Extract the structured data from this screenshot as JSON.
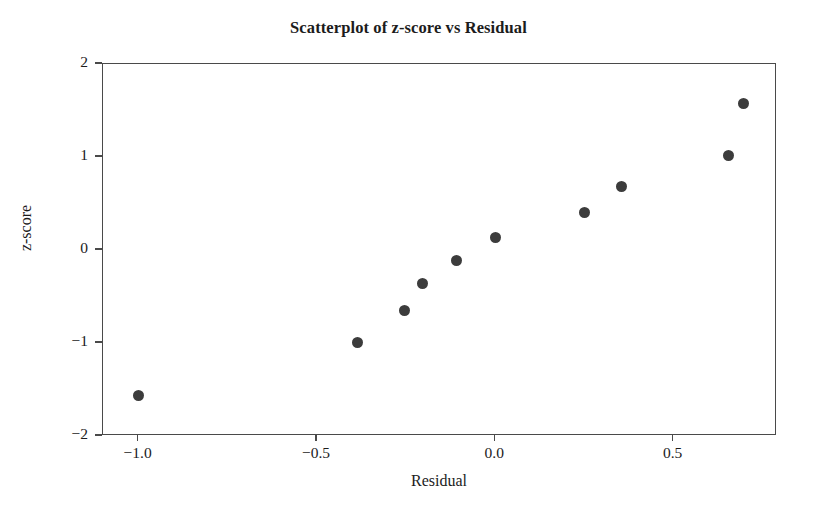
{
  "chart_data": {
    "type": "scatter",
    "title": "Scatterplot of z-score vs Residual",
    "xlabel": "Residual",
    "ylabel": "z-score",
    "xlim": [
      -1.1,
      0.79
    ],
    "ylim": [
      -2.0,
      2.0
    ],
    "grid": false,
    "legend": null,
    "marker": {
      "shape": "circle",
      "color": "#3c3c3c",
      "size_px": 11
    },
    "frame_color": "#4a4a4a",
    "background": "#ffffff",
    "xticks": [
      -1.0,
      -0.5,
      0.0,
      0.5
    ],
    "xticklabels": [
      "−1.0",
      "−0.5",
      "0.0",
      "0.5"
    ],
    "yticks": [
      2,
      1,
      0,
      -1,
      -2
    ],
    "yticklabels": [
      "2",
      "1",
      "0",
      "−1",
      "−2"
    ],
    "x": [
      -1.0,
      -0.385,
      -0.255,
      -0.205,
      -0.11,
      0.0,
      0.25,
      0.355,
      0.655,
      0.695
    ],
    "y": [
      -1.56,
      -0.99,
      -0.65,
      -0.36,
      -0.11,
      0.13,
      0.4,
      0.68,
      1.02,
      1.57
    ],
    "points": [
      {
        "x": -1.0,
        "y": -1.56
      },
      {
        "x": -0.385,
        "y": -0.99
      },
      {
        "x": -0.255,
        "y": -0.65
      },
      {
        "x": -0.205,
        "y": -0.36
      },
      {
        "x": -0.11,
        "y": -0.11
      },
      {
        "x": 0.0,
        "y": 0.13
      },
      {
        "x": 0.25,
        "y": 0.4
      },
      {
        "x": 0.355,
        "y": 0.68
      },
      {
        "x": 0.655,
        "y": 1.02
      },
      {
        "x": 0.695,
        "y": 1.57
      }
    ]
  }
}
